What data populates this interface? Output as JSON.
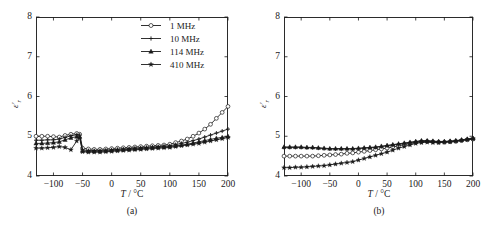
{
  "figure": {
    "background": "#ffffff",
    "line_color": "#1a1a1a"
  },
  "chart_data": [
    {
      "type": "line",
      "panel": "(a)",
      "title": "",
      "xlabel": "T / °C",
      "ylabel": "ε'r",
      "xlim": [
        -130,
        200
      ],
      "ylim": [
        4,
        8
      ],
      "xticks": [
        -100,
        -50,
        0,
        50,
        100,
        150,
        200
      ],
      "yticks": [
        4,
        5,
        6,
        7,
        8
      ],
      "grid": false,
      "legend_position": "top-right",
      "x": [
        -130,
        -120,
        -110,
        -100,
        -90,
        -80,
        -70,
        -60,
        -55,
        -50,
        -40,
        -30,
        -20,
        -10,
        0,
        10,
        20,
        30,
        40,
        50,
        60,
        70,
        80,
        90,
        100,
        110,
        120,
        130,
        140,
        150,
        160,
        170,
        180,
        190,
        200
      ],
      "series": [
        {
          "name": "1 MHz",
          "marker": "circle-open",
          "values": [
            5.0,
            5.0,
            5.0,
            4.99,
            4.98,
            5.02,
            5.05,
            5.07,
            5.05,
            4.7,
            4.68,
            4.67,
            4.67,
            4.68,
            4.69,
            4.7,
            4.71,
            4.72,
            4.73,
            4.74,
            4.75,
            4.76,
            4.77,
            4.78,
            4.8,
            4.84,
            4.88,
            4.93,
            5.0,
            5.08,
            5.18,
            5.3,
            5.45,
            5.6,
            5.75
          ]
        },
        {
          "name": "10 MHz",
          "marker": "plus",
          "values": [
            4.9,
            4.9,
            4.91,
            4.91,
            4.93,
            4.97,
            5.01,
            5.04,
            5.03,
            4.66,
            4.64,
            4.64,
            4.64,
            4.65,
            4.66,
            4.67,
            4.68,
            4.69,
            4.7,
            4.71,
            4.72,
            4.73,
            4.74,
            4.75,
            4.76,
            4.79,
            4.82,
            4.85,
            4.89,
            4.93,
            4.98,
            5.03,
            5.08,
            5.13,
            5.18
          ]
        },
        {
          "name": "114 MHz",
          "marker": "triangle",
          "values": [
            4.82,
            4.82,
            4.83,
            4.84,
            4.86,
            4.91,
            4.96,
            4.99,
            4.98,
            4.63,
            4.62,
            4.62,
            4.62,
            4.63,
            4.64,
            4.65,
            4.66,
            4.67,
            4.68,
            4.69,
            4.7,
            4.71,
            4.72,
            4.73,
            4.74,
            4.76,
            4.78,
            4.8,
            4.83,
            4.86,
            4.89,
            4.92,
            4.95,
            4.97,
            5.0
          ]
        },
        {
          "name": "410 MHz",
          "marker": "star",
          "values": [
            4.7,
            4.7,
            4.71,
            4.72,
            4.74,
            4.72,
            4.66,
            4.88,
            4.96,
            4.61,
            4.6,
            4.6,
            4.6,
            4.61,
            4.62,
            4.63,
            4.64,
            4.65,
            4.66,
            4.67,
            4.68,
            4.69,
            4.7,
            4.71,
            4.72,
            4.74,
            4.76,
            4.78,
            4.8,
            4.82,
            4.85,
            4.88,
            4.91,
            4.94,
            4.97
          ]
        }
      ]
    },
    {
      "type": "line",
      "panel": "(b)",
      "title": "",
      "xlabel": "T / °C",
      "ylabel": "ε'r",
      "xlim": [
        -130,
        200
      ],
      "ylim": [
        4,
        8
      ],
      "xticks": [
        -100,
        -50,
        0,
        50,
        100,
        150,
        200
      ],
      "yticks": [
        4,
        5,
        6,
        7,
        8
      ],
      "grid": false,
      "legend_position": "top-right",
      "x": [
        -130,
        -120,
        -110,
        -100,
        -90,
        -80,
        -70,
        -60,
        -50,
        -40,
        -30,
        -20,
        -10,
        0,
        10,
        20,
        30,
        40,
        50,
        60,
        70,
        80,
        90,
        100,
        110,
        120,
        130,
        140,
        150,
        160,
        170,
        180,
        190,
        200
      ],
      "series": [
        {
          "name": "850 MHz",
          "marker": "circle-open",
          "values": [
            4.5,
            4.5,
            4.5,
            4.5,
            4.5,
            4.5,
            4.51,
            4.52,
            4.53,
            4.54,
            4.55,
            4.57,
            4.58,
            4.6,
            4.62,
            4.64,
            4.66,
            4.68,
            4.7,
            4.73,
            4.76,
            4.79,
            4.82,
            4.84,
            4.86,
            4.87,
            4.86,
            4.85,
            4.85,
            4.86,
            4.87,
            4.89,
            4.91,
            4.93
          ]
        },
        {
          "name": "1.02 GHz",
          "marker": "plus",
          "values": [
            4.72,
            4.72,
            4.72,
            4.72,
            4.71,
            4.71,
            4.7,
            4.69,
            4.68,
            4.68,
            4.68,
            4.68,
            4.68,
            4.69,
            4.7,
            4.71,
            4.72,
            4.74,
            4.76,
            4.78,
            4.8,
            4.82,
            4.84,
            4.86,
            4.88,
            4.88,
            4.87,
            4.86,
            4.86,
            4.87,
            4.88,
            4.9,
            4.92,
            4.94
          ]
        },
        {
          "name": "2.54 GHz",
          "marker": "triangle",
          "values": [
            4.73,
            4.73,
            4.73,
            4.73,
            4.72,
            4.72,
            4.71,
            4.7,
            4.69,
            4.69,
            4.69,
            4.69,
            4.69,
            4.7,
            4.71,
            4.72,
            4.73,
            4.75,
            4.77,
            4.79,
            4.81,
            4.83,
            4.85,
            4.87,
            4.89,
            4.89,
            4.88,
            4.87,
            4.87,
            4.88,
            4.89,
            4.91,
            4.93,
            4.95
          ]
        },
        {
          "name": "3.0 GHz",
          "marker": "star",
          "values": [
            4.21,
            4.21,
            4.22,
            4.22,
            4.23,
            4.24,
            4.25,
            4.26,
            4.28,
            4.3,
            4.32,
            4.34,
            4.36,
            4.4,
            4.44,
            4.48,
            4.52,
            4.56,
            4.6,
            4.65,
            4.7,
            4.74,
            4.78,
            4.82,
            4.84,
            4.85,
            4.84,
            4.84,
            4.85,
            4.86,
            4.88,
            4.9,
            4.92,
            4.94
          ]
        }
      ]
    }
  ]
}
